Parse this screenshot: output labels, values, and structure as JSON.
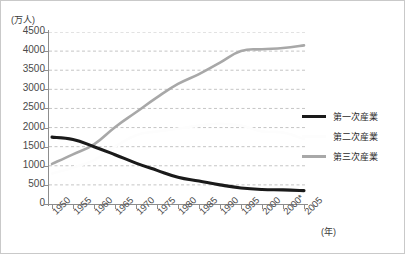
{
  "chart_data": {
    "type": "line",
    "title": "",
    "subtitle": "",
    "xlabel": "(年)",
    "ylabel": "(万人)",
    "ylim": [
      0,
      4500
    ],
    "ytick_step": 500,
    "ytick_labels": [
      "4500",
      "4000",
      "3500",
      "3000",
      "2500",
      "2000",
      "1500",
      "1000",
      "500",
      "0"
    ],
    "ytick_values": [
      4500,
      4000,
      3500,
      3000,
      2500,
      2000,
      1500,
      1000,
      500,
      0
    ],
    "grid": "horizontal-dashed",
    "legend_position": "right",
    "categories": [
      "1950",
      "1955",
      "1960",
      "1965",
      "1970",
      "1975",
      "1980",
      "1985",
      "1990",
      "1995",
      "2000",
      "2000*",
      "2005"
    ],
    "series": [
      {
        "name": "第一次産業",
        "color": "#1a1a1a",
        "values": [
          1750,
          1690,
          1500,
          1290,
          1070,
          880,
          700,
          600,
          500,
          420,
          380,
          370,
          350
        ]
      },
      {
        "name": "第二次産業",
        "color": "#fdfdfd",
        "values": [
          800,
          950,
          1150,
          1500,
          1800,
          1900,
          1970,
          2050,
          2100,
          2050,
          1900,
          1870,
          1700
        ]
      },
      {
        "name": "第三次産業",
        "color": "#a8a8a8",
        "values": [
          1050,
          1300,
          1560,
          2010,
          2400,
          2790,
          3140,
          3400,
          3700,
          4000,
          4050,
          4080,
          4150
        ]
      }
    ]
  },
  "axis": {
    "unit_caption": "(万人)",
    "year_caption": "(年)"
  },
  "legend": {
    "items": [
      {
        "label": "第一次産業",
        "color": "#1a1a1a"
      },
      {
        "label": "第二次産業",
        "color": "#fdfdfd"
      },
      {
        "label": "第三次産業",
        "color": "#a8a8a8"
      }
    ]
  }
}
